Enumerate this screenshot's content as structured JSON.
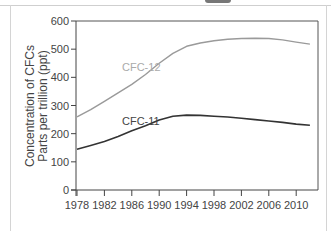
{
  "chart_data": {
    "type": "line",
    "title": "",
    "xlabel": "",
    "ylabel": "Concentration of CFCs Parts per trillion (ppt)",
    "ylabel_lines": [
      "Concentration of CFCs",
      "Parts per trillion (ppt)"
    ],
    "ylim": [
      0,
      600
    ],
    "xlim": [
      1978,
      2012
    ],
    "yticks": [
      "0",
      "100",
      "200",
      "300",
      "400",
      "500",
      "600"
    ],
    "xticks": [
      "1978",
      "1982",
      "1986",
      "1990",
      "1994",
      "1998",
      "2002",
      "2006",
      "2010"
    ],
    "grid": false,
    "legend": "inline labels",
    "x": [
      1978,
      1980,
      1982,
      1984,
      1986,
      1988,
      1990,
      1992,
      1994,
      1996,
      1998,
      2000,
      2002,
      2004,
      2006,
      2008,
      2010,
      2012
    ],
    "series": [
      {
        "name": "CFC-12",
        "color": "#9a9a9a",
        "values": [
          260,
          285,
          315,
          345,
          375,
          410,
          450,
          485,
          510,
          522,
          530,
          535,
          538,
          539,
          538,
          533,
          525,
          518
        ]
      },
      {
        "name": "CFC-11",
        "color": "#333333",
        "values": [
          145,
          158,
          172,
          190,
          210,
          228,
          248,
          262,
          266,
          265,
          262,
          259,
          255,
          250,
          245,
          240,
          234,
          230
        ]
      }
    ]
  },
  "labels": {
    "cfc12": "CFC-12",
    "cfc11": "CFC-11"
  },
  "caption": "3. Concentration of two CFCs in the atmosphere from 1978 to 2012"
}
